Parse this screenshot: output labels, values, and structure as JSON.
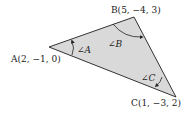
{
  "diagram": {
    "type": "triangle",
    "fill_color": "#d9d9d9",
    "stroke_color": "#333333",
    "vertices": [
      {
        "id": "A",
        "label": "A(2, −1, 0)",
        "coords": [
          2,
          -1,
          0
        ]
      },
      {
        "id": "B",
        "label": "B(5, −4, 3)",
        "coords": [
          5,
          -4,
          3
        ]
      },
      {
        "id": "C",
        "label": "C(1, −3, 2)",
        "coords": [
          1,
          -3,
          2
        ]
      }
    ],
    "angles": [
      {
        "vertex": "A",
        "label": "∠A"
      },
      {
        "vertex": "B",
        "label": "∠B"
      },
      {
        "vertex": "C",
        "label": "∠C"
      }
    ]
  }
}
